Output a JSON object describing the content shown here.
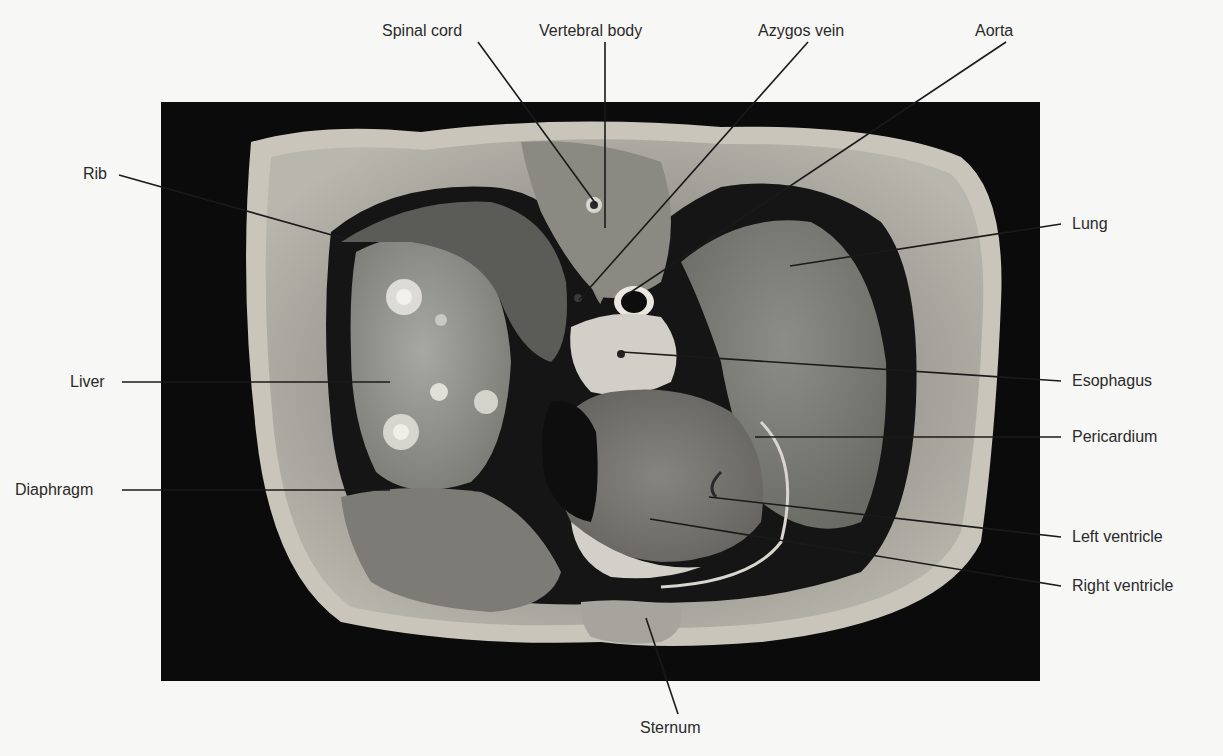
{
  "figure": {
    "labels": {
      "spinal_cord": "Spinal cord",
      "vertebral_body": "Vertebral body",
      "azygos_vein": "Azygos vein",
      "aorta": "Aorta",
      "rib": "Rib",
      "lung": "Lung",
      "liver": "Liver",
      "esophagus": "Esophagus",
      "pericardium": "Pericardium",
      "diaphragm": "Diaphragm",
      "left_ventricle": "Left ventricle",
      "right_ventricle": "Right ventricle",
      "sternum": "Sternum"
    },
    "colors": {
      "background": "#f7f7f5",
      "photo_background": "#0b0b0b",
      "label_text": "#2a2a2a",
      "leader_line": "#1a1a1a"
    }
  }
}
